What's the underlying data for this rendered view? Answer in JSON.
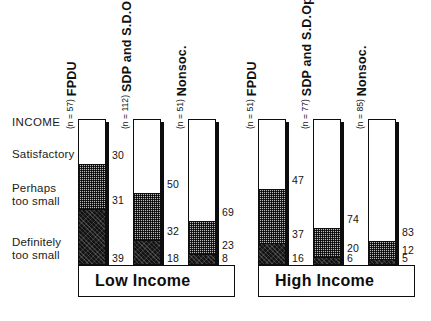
{
  "figure": {
    "left_axis_labels": {
      "title": "INCOME",
      "satisfactory": "Satisfactory",
      "perhaps_too_small": "Perhaps\ntoo small",
      "definitely_too_small": "Definitely\ntoo small"
    },
    "groups": [
      {
        "id": "low-income",
        "label": "Low Income"
      },
      {
        "id": "high-income",
        "label": "High Income"
      }
    ]
  },
  "chart_data": {
    "type": "bar",
    "title": "INCOME",
    "subtype": "stacked-percentage",
    "xlabel": "",
    "ylabel": "",
    "ylim": [
      0,
      100
    ],
    "grid": false,
    "legend_position": "left-axis",
    "categories": [
      "FPDU (Low Income)",
      "SDP and S.D.Opp. (Low Income)",
      "Nonsoc. (Low Income)",
      "FPDU (High Income)",
      "SDP and S.D.Opp. (High Income)",
      "Nonsoc. (High Income)"
    ],
    "series": [
      {
        "name": "Satisfactory",
        "pattern": "white",
        "values": [
          30,
          50,
          69,
          47,
          74,
          83
        ]
      },
      {
        "name": "Perhaps too small",
        "pattern": "crosshatch",
        "values": [
          31,
          32,
          23,
          37,
          20,
          12
        ]
      },
      {
        "name": "Definitely too small",
        "pattern": "dark",
        "values": [
          39,
          18,
          8,
          16,
          6,
          5
        ]
      }
    ],
    "sample_sizes": [
      57,
      112,
      51,
      51,
      77,
      85
    ]
  },
  "bars": [
    {
      "id": "low-fpdu",
      "group": "Low Income",
      "party": "FPDU",
      "n_label": "(n = 57)",
      "satisfactory": "30",
      "perhaps": "31",
      "definitely": "39"
    },
    {
      "id": "low-sdp",
      "group": "Low Income",
      "party": "SDP and S.D.Opp.",
      "n_label": "(n = 112)",
      "satisfactory": "50",
      "perhaps": "32",
      "definitely": "18"
    },
    {
      "id": "low-nonsoc",
      "group": "Low Income",
      "party": "Nonsoc.",
      "n_label": "(n = 51)",
      "satisfactory": "69",
      "perhaps": "23",
      "definitely": "8"
    },
    {
      "id": "high-fpdu",
      "group": "High Income",
      "party": "FPDU",
      "n_label": "(n = 51)",
      "satisfactory": "47",
      "perhaps": "37",
      "definitely": "16"
    },
    {
      "id": "high-sdp",
      "group": "High Income",
      "party": "SDP and S.D.Opp.",
      "n_label": "(n = 77)",
      "satisfactory": "74",
      "perhaps": "20",
      "definitely": "6"
    },
    {
      "id": "high-nonsoc",
      "group": "High Income",
      "party": "Nonsoc.",
      "n_label": "(n = 85)",
      "satisfactory": "83",
      "perhaps": "12",
      "definitely": "5"
    }
  ]
}
